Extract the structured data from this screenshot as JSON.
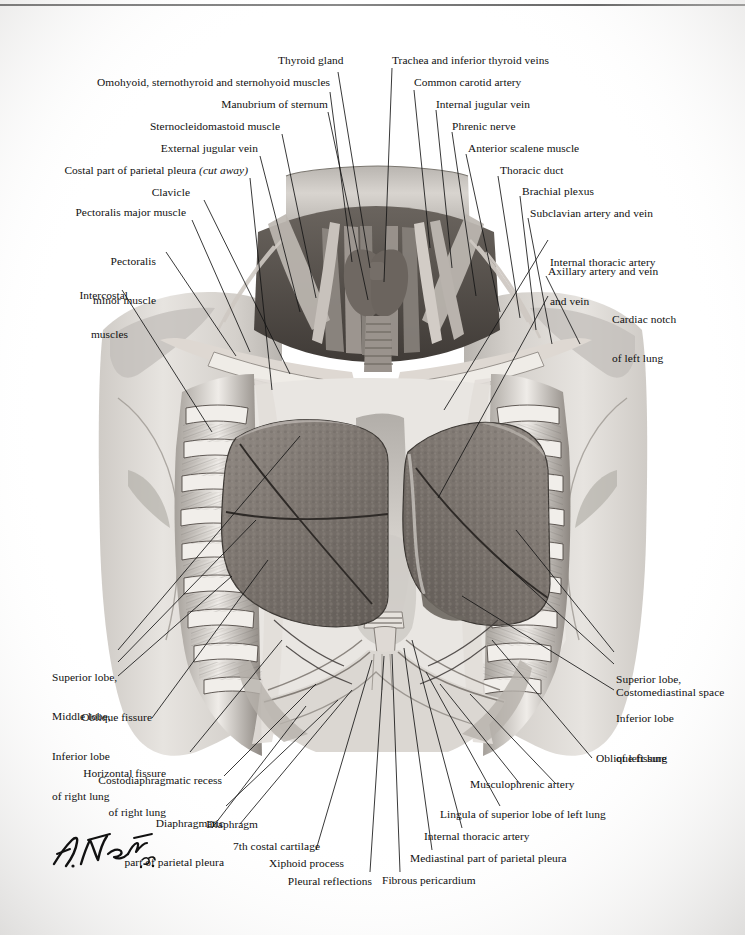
{
  "plate": {
    "title": "Thorax: anterior view of lungs in situ",
    "artist_signature": "F. Netter, M.D.",
    "ink_color": "#101010",
    "rule_color": "#6d6d6d"
  },
  "labels_left": [
    {
      "name": "omohyoid-sternothyroid-sternohyoid-muscles",
      "text": "Omohyoid, sternothyroid and sternohyoid muscles"
    },
    {
      "name": "manubrium-of-sternum",
      "text": "Manubrium of sternum"
    },
    {
      "name": "sternocleidomastoid-muscle",
      "text": "Sternocleidomastoid muscle"
    },
    {
      "name": "external-jugular-vein",
      "text": "External jugular vein"
    },
    {
      "name": "costal-part-of-parietal-pleura",
      "text": "Costal part of parietal pleura ",
      "italic": "(cut away)"
    },
    {
      "name": "clavicle",
      "text": "Clavicle"
    },
    {
      "name": "pectoralis-major-muscle",
      "text": "Pectoralis major muscle"
    },
    {
      "name": "pectoralis-minor-muscle",
      "line1": "Pectoralis",
      "line2": "minor muscle"
    },
    {
      "name": "intercostal-muscles",
      "line1": "Intercostal",
      "line2": "muscles"
    }
  ],
  "labels_top_center": [
    {
      "name": "thyroid-gland",
      "text": "Thyroid gland"
    }
  ],
  "labels_right": [
    {
      "name": "trachea-and-inferior-thyroid-veins",
      "text": "Trachea and inferior thyroid veins"
    },
    {
      "name": "common-carotid-artery",
      "text": "Common carotid artery"
    },
    {
      "name": "internal-jugular-vein",
      "text": "Internal jugular vein"
    },
    {
      "name": "phrenic-nerve",
      "text": "Phrenic nerve"
    },
    {
      "name": "anterior-scalene-muscle",
      "text": "Anterior scalene muscle"
    },
    {
      "name": "thoracic-duct",
      "text": "Thoracic duct"
    },
    {
      "name": "brachial-plexus",
      "text": "Brachial plexus"
    },
    {
      "name": "subclavian-artery-and-vein",
      "text": "Subclavian artery and vein"
    },
    {
      "name": "internal-thoracic-artery-and-vein",
      "line1": "Internal thoracic artery",
      "line2": "and vein"
    },
    {
      "name": "axillary-artery-and-vein",
      "text": "Axillary artery and vein"
    },
    {
      "name": "cardiac-notch-of-left-lung",
      "line1": "Cardiac notch",
      "line2": "of left lung"
    }
  ],
  "labels_lower_left": [
    {
      "name": "lobes-of-right-lung",
      "line1": "Superior lobe,",
      "line2": "Middle lobe,",
      "line3": "Inferior lobe",
      "line4": "of right lung"
    },
    {
      "name": "oblique-fissure-right",
      "text": "Oblique fissure"
    },
    {
      "name": "horizontal-fissure-of-right-lung",
      "line1": "Horizontal fissure",
      "line2": "of right lung"
    },
    {
      "name": "costodiaphragmatic-recess",
      "text": "Costodiaphragmatic recess"
    },
    {
      "name": "diaphragmatic-part-of-parietal-pleura",
      "line1": "Diaphragmatic",
      "line2": "part of parietal pleura"
    },
    {
      "name": "diaphragm",
      "text": "Diaphragm"
    },
    {
      "name": "seventh-costal-cartilage",
      "text": "7th costal cartilage"
    },
    {
      "name": "xiphoid-process",
      "text": "Xiphoid process"
    },
    {
      "name": "pleural-reflections",
      "text": "Pleural reflections"
    }
  ],
  "labels_lower_right": [
    {
      "name": "lobes-of-left-lung",
      "line1": "Superior lobe,",
      "line2": "Inferior lobe",
      "line3": "of left lung"
    },
    {
      "name": "costomediastinal-space",
      "text": "Costomediastinal space"
    },
    {
      "name": "oblique-fissure-left",
      "text": "Oblique fissure"
    },
    {
      "name": "musculophrenic-artery",
      "text": "Musculophrenic artery"
    },
    {
      "name": "lingula-of-superior-lobe-of-left-lung",
      "text": "Lingula of superior lobe of left lung"
    },
    {
      "name": "internal-thoracic-artery",
      "text": "Internal thoracic artery"
    },
    {
      "name": "mediastinal-part-of-parietal-pleura",
      "text": "Mediastinal part of parietal pleura"
    },
    {
      "name": "fibrous-pericardium",
      "text": "Fibrous pericardium"
    }
  ]
}
